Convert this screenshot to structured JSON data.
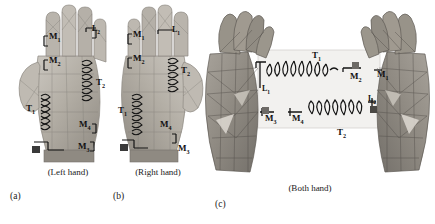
{
  "figure": {
    "panels": [
      {
        "id": "a",
        "sublabel": "(a)",
        "caption": "(Left hand)",
        "view": "palmar-hand-mesh",
        "labels": [
          {
            "name": "M1",
            "base": "M",
            "sub": "1"
          },
          {
            "name": "M2",
            "base": "M",
            "sub": "2"
          },
          {
            "name": "M3",
            "base": "M",
            "sub": "3"
          },
          {
            "name": "M4",
            "base": "M",
            "sub": "4"
          },
          {
            "name": "T1",
            "base": "T",
            "sub": "1"
          },
          {
            "name": "T2",
            "base": "T",
            "sub": "2"
          },
          {
            "name": "L2",
            "base": "L",
            "sub": "2"
          }
        ]
      },
      {
        "id": "b",
        "sublabel": "(b)",
        "caption": "(Right hand)",
        "view": "palmar-hand-mesh",
        "labels": [
          {
            "name": "M1",
            "base": "M",
            "sub": "1"
          },
          {
            "name": "M2",
            "base": "M",
            "sub": "2"
          },
          {
            "name": "M3",
            "base": "M",
            "sub": "3"
          },
          {
            "name": "M4",
            "base": "M",
            "sub": "4"
          },
          {
            "name": "T1",
            "base": "T",
            "sub": "1"
          },
          {
            "name": "T2",
            "base": "T",
            "sub": "2"
          },
          {
            "name": "L1",
            "base": "L",
            "sub": "1"
          }
        ]
      },
      {
        "id": "c",
        "sublabel": "(c)",
        "caption": "(Both hand)",
        "view": "two-hands-facing-mesh",
        "labels": [
          {
            "name": "T1",
            "base": "T",
            "sub": "1"
          },
          {
            "name": "T2",
            "base": "T",
            "sub": "2"
          },
          {
            "name": "L1",
            "base": "L",
            "sub": "1"
          },
          {
            "name": "L2",
            "base": "L",
            "sub": "2"
          },
          {
            "name": "M1",
            "base": "M",
            "sub": "1"
          },
          {
            "name": "M2",
            "base": "M",
            "sub": "2"
          },
          {
            "name": "M3",
            "base": "M",
            "sub": "3"
          },
          {
            "name": "M4",
            "base": "M",
            "sub": "4"
          }
        ]
      }
    ]
  },
  "colors": {
    "background": "#ffffff",
    "mesh_light": "#c9c6c0",
    "mesh_mid": "#9a968f",
    "mesh_dark": "#6d6a65",
    "ink": "#111111",
    "skin_tone": "#b8b2a8"
  }
}
